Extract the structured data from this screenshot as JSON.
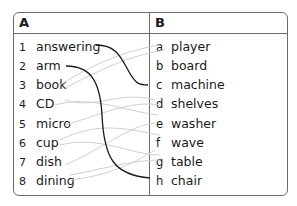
{
  "headers": {
    "a": "A",
    "b": "B"
  },
  "column_a": [
    {
      "num": "1",
      "word": "answering"
    },
    {
      "num": "2",
      "word": "arm"
    },
    {
      "num": "3",
      "word": "book"
    },
    {
      "num": "4",
      "word": "CD"
    },
    {
      "num": "5",
      "word": "micro"
    },
    {
      "num": "6",
      "word": "cup"
    },
    {
      "num": "7",
      "word": "dish"
    },
    {
      "num": "8",
      "word": "dining"
    }
  ],
  "column_b": [
    {
      "letter": "a",
      "word": "player"
    },
    {
      "letter": "b",
      "word": "board"
    },
    {
      "letter": "c",
      "word": "machine"
    },
    {
      "letter": "d",
      "word": "shelves"
    },
    {
      "letter": "e",
      "word": "washer"
    },
    {
      "letter": "f",
      "word": "wave"
    },
    {
      "letter": "g",
      "word": "table"
    },
    {
      "letter": "h",
      "word": "chair"
    }
  ],
  "example_matches": [
    {
      "from": "answering",
      "to": "machine"
    },
    {
      "from": "arm",
      "to": "chair"
    }
  ],
  "colors": {
    "border": "#6b6b6b",
    "example_line": "#1a1a1a",
    "faint_line": "#c8c8c8"
  }
}
